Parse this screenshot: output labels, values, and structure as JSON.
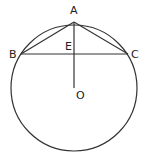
{
  "diagram": {
    "type": "geometry-circle-chord",
    "colors": {
      "stroke": "#333333",
      "text": "#222222",
      "background": "#ffffff"
    },
    "circle": {
      "center": "O",
      "cx": 74,
      "cy": 88,
      "r": 63
    },
    "points": {
      "A": {
        "label": "A",
        "x": 74,
        "y": 22
      },
      "B": {
        "label": "B",
        "x": 21,
        "y": 54
      },
      "C": {
        "label": "C",
        "x": 128,
        "y": 54
      },
      "E": {
        "label": "E",
        "x": 74,
        "y": 54
      },
      "O": {
        "label": "O",
        "x": 74,
        "y": 88
      }
    },
    "segments": [
      "AB",
      "AC",
      "BC",
      "AO"
    ]
  }
}
